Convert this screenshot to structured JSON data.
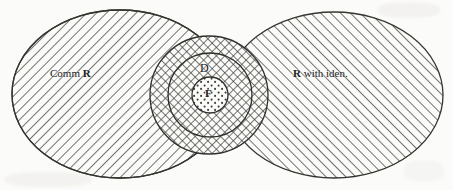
{
  "figure": {
    "background_color": "#fbfbf9",
    "ink_color": "#3a3a38",
    "regions": [
      {
        "id": "comm-r",
        "shape": "ellipse",
        "label_plain": "Comm R",
        "label_prefix": "Comm ",
        "label_bold": "R",
        "label_suffix": "",
        "fill": "diagonal-hatch-down",
        "cx": 120,
        "cy": 94,
        "rx": 108,
        "ry": 84
      },
      {
        "id": "r-with-iden",
        "shape": "ellipse",
        "label_plain": "R with iden.",
        "label_prefix": "",
        "label_bold": "R",
        "label_suffix": " with iden.",
        "fill": "diagonal-hatch-up",
        "cx": 334,
        "cy": 95,
        "rx": 109,
        "ry": 83
      },
      {
        "id": "outer-circle",
        "shape": "circle",
        "label_plain": "",
        "fill": "cross-hatch",
        "cx": 209,
        "cy": 95,
        "r": 59
      },
      {
        "id": "d-circle",
        "shape": "circle",
        "label_plain": "D",
        "fill": "cross-hatch",
        "cx": 210,
        "cy": 95,
        "r": 42
      },
      {
        "id": "f-circle",
        "shape": "circle",
        "label_plain": "F",
        "fill": "dotted",
        "cx": 210,
        "cy": 95,
        "r": 18
      }
    ]
  },
  "labels": {
    "comm_r_prefix": "Comm ",
    "comm_r_bold": "R",
    "r_iden_bold": "R",
    "r_iden_suffix": " with iden.",
    "d": "D",
    "f": "F"
  }
}
